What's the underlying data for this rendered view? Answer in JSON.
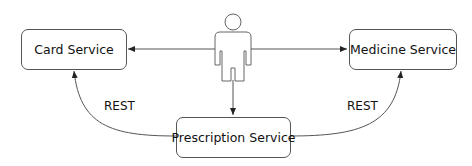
{
  "nodes": {
    "card": {
      "label": "Card Service"
    },
    "medicine": {
      "label": "Medicine Service"
    },
    "prescription": {
      "label": "Prescription Service"
    },
    "actor": {
      "label": "User"
    }
  },
  "edges": {
    "left_label": "REST",
    "right_label": "REST"
  },
  "colors": {
    "stroke": "#555555",
    "text": "#111111",
    "background": "#ffffff"
  }
}
